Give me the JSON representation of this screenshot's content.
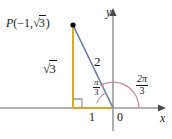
{
  "figure": {
    "type": "diagram",
    "colors": {
      "axis": "#9a9a9a",
      "leg": "#d9a92b",
      "hypotenuse": "#6b7aa8",
      "arc": "#c98a9a",
      "text": "#1a1a1a",
      "point": "#000000",
      "background": "#ffffff"
    },
    "labels": {
      "point_label_prefix": "P",
      "point_open_paren": "(",
      "point_x": "−1,",
      "point_close_paren": ")",
      "radical_sign": "√",
      "radicand_3": "3",
      "vertical_leg": "3",
      "hypotenuse": "2",
      "horizontal_leg": "1",
      "origin": "0",
      "x_axis": "x",
      "y_axis": "y",
      "angle_small_num": "π",
      "angle_small_den": "3",
      "angle_big_num": "2π",
      "angle_big_den": "3"
    },
    "geometry": {
      "origin": {
        "x": 113,
        "y": 108
      },
      "point_P": {
        "x": 73,
        "y": 25
      },
      "foot": {
        "x": 73,
        "y": 108
      },
      "x_axis_from": 0,
      "x_axis_to": 162,
      "y_axis_top": 12,
      "y_axis_bottom": 131,
      "radius_small_arc": 17,
      "radius_big_arc": 26
    },
    "values": {
      "point_x": -1,
      "point_y": 1.7320508,
      "hypotenuse": 2,
      "opposite": 1.7320508,
      "adjacent": 1,
      "reference_angle_rad": 1.0471976,
      "standard_angle_rad": 2.0943951
    }
  }
}
